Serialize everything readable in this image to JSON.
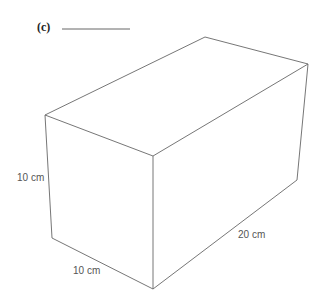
{
  "question": {
    "part_label": "(c)",
    "answer_blank": ""
  },
  "figure": {
    "type": "rectangular-prism",
    "dimensions": {
      "height": "10 cm",
      "width": "10 cm",
      "length": "20 cm"
    }
  }
}
